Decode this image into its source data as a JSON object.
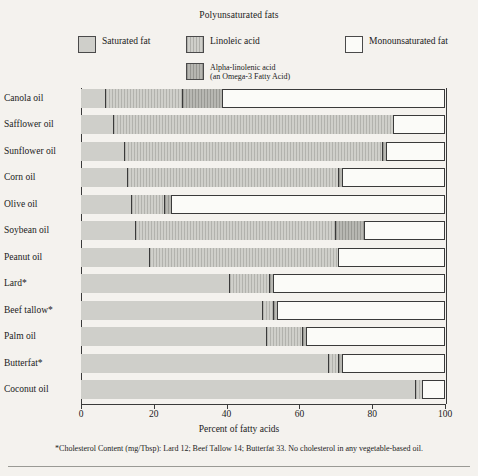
{
  "legend": {
    "group_title": "Polyunsaturated fats",
    "items": [
      {
        "key": "sat",
        "label": "Saturated fat",
        "sublabel": "",
        "swatch": "solid-gray"
      },
      {
        "key": "lin",
        "label": "Linoleic acid",
        "sublabel": "",
        "swatch": "hatched-light-gray"
      },
      {
        "key": "ala",
        "label": "Alpha-linolenic acid",
        "sublabel": "(an Omega-3 Fatty Acid)",
        "swatch": "hatched-dark-gray"
      },
      {
        "key": "mono",
        "label": "Monounsaturated fat",
        "sublabel": "",
        "swatch": "white"
      }
    ]
  },
  "axis": {
    "xlabel": "Percent of fatty acids",
    "ticks": [
      "0",
      "20",
      "40",
      "60",
      "80",
      "100"
    ]
  },
  "footnote": "*Cholesterol Content (mg/Tbsp): Lard 12; Beef Tallow 14; Butterfat 33. No cholesterol in any vegetable-based oil.",
  "colors": {
    "background": "#f4f2ee",
    "saturated": "#cfcfca",
    "linoleic": "#cfcfca",
    "alpha_linolenic": "#b7b7b2",
    "monounsaturated": "#fbfbf8",
    "outline": "#3a3a3a"
  },
  "chart_data": {
    "type": "bar",
    "orientation": "horizontal",
    "stacked": true,
    "title": "",
    "xlabel": "Percent of fatty acids",
    "ylabel": "",
    "xlim": [
      0,
      100
    ],
    "grid": false,
    "legend_position": "top",
    "categories": [
      "Canola oil",
      "Safflower oil",
      "Sunflower oil",
      "Corn oil",
      "Olive oil",
      "Soybean oil",
      "Peanut oil",
      "Lard*",
      "Beef tallow*",
      "Palm oil",
      "Butterfat*",
      "Coconut oil"
    ],
    "series": [
      {
        "name": "Saturated fat",
        "values": [
          7,
          9,
          12,
          13,
          14,
          15,
          19,
          41,
          50,
          51,
          68,
          92
        ]
      },
      {
        "name": "Linoleic acid",
        "values": [
          21,
          77,
          71,
          58,
          9,
          55,
          52,
          11,
          3,
          10,
          3,
          2
        ]
      },
      {
        "name": "Alpha-linolenic acid",
        "values": [
          11,
          0,
          1,
          1,
          2,
          8,
          0,
          1,
          1,
          1,
          1,
          0
        ]
      },
      {
        "name": "Monounsaturated fat",
        "values": [
          61,
          14,
          16,
          28,
          75,
          22,
          29,
          47,
          46,
          38,
          28,
          6
        ]
      }
    ],
    "bars": [
      {
        "label": "Canola oil",
        "sat": 7,
        "lin_end": 28,
        "ala_end": 39,
        "total": 100
      },
      {
        "label": "Safflower oil",
        "sat": 9,
        "lin_end": 86,
        "ala_end": 86,
        "total": 100
      },
      {
        "label": "Sunflower oil",
        "sat": 12,
        "lin_end": 83,
        "ala_end": 84,
        "total": 100
      },
      {
        "label": "Corn oil",
        "sat": 13,
        "lin_end": 71,
        "ala_end": 72,
        "total": 100
      },
      {
        "label": "Olive oil",
        "sat": 14,
        "lin_end": 23,
        "ala_end": 25,
        "total": 100
      },
      {
        "label": "Soybean oil",
        "sat": 15,
        "lin_end": 70,
        "ala_end": 78,
        "total": 100
      },
      {
        "label": "Peanut oil",
        "sat": 19,
        "lin_end": 71,
        "ala_end": 71,
        "total": 100
      },
      {
        "label": "Lard*",
        "sat": 41,
        "lin_end": 52,
        "ala_end": 53,
        "total": 100
      },
      {
        "label": "Beef tallow*",
        "sat": 50,
        "lin_end": 53,
        "ala_end": 54,
        "total": 100
      },
      {
        "label": "Palm oil",
        "sat": 51,
        "lin_end": 61,
        "ala_end": 62,
        "total": 100
      },
      {
        "label": "Butterfat*",
        "sat": 68,
        "lin_end": 71,
        "ala_end": 72,
        "total": 100
      },
      {
        "label": "Coconut oil",
        "sat": 92,
        "lin_end": 94,
        "ala_end": 94,
        "total": 100
      }
    ]
  }
}
